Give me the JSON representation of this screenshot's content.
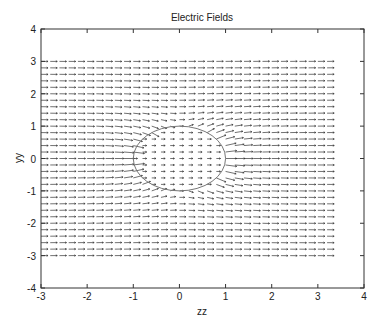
{
  "chart_data": {
    "type": "quiver",
    "title": "Electric Fields",
    "xlabel": "zz",
    "ylabel": "yy",
    "xlim": [
      -3,
      4
    ],
    "ylim": [
      -4,
      4
    ],
    "xticks": [
      -3,
      -2,
      -1,
      0,
      1,
      2,
      3,
      4
    ],
    "yticks": [
      -4,
      -3,
      -2,
      -1,
      0,
      1,
      2,
      3,
      4
    ],
    "xtick_labels": [
      "-3",
      "-2",
      "-1",
      "0",
      "1",
      "2",
      "3",
      "4"
    ],
    "ytick_labels": [
      "-4",
      "-3",
      "-2",
      "-1",
      "0",
      "1",
      "2",
      "3",
      "4"
    ],
    "grid": false,
    "legend": null,
    "quiver_grid": {
      "x_start": -3.0,
      "x_end": 3.2,
      "x_step": 0.2,
      "y_start": -3.0,
      "y_end": 3.0,
      "y_step": 0.2
    },
    "field_description": "Uniform field in +z direction distorted by dielectric sphere of radius 1 at origin; weaker uniform field inside",
    "circle": {
      "cx": 0,
      "cy": 0,
      "r": 1
    },
    "colors": {
      "arrows": "#333333",
      "circle": "#777777",
      "axes": "#333333"
    }
  }
}
